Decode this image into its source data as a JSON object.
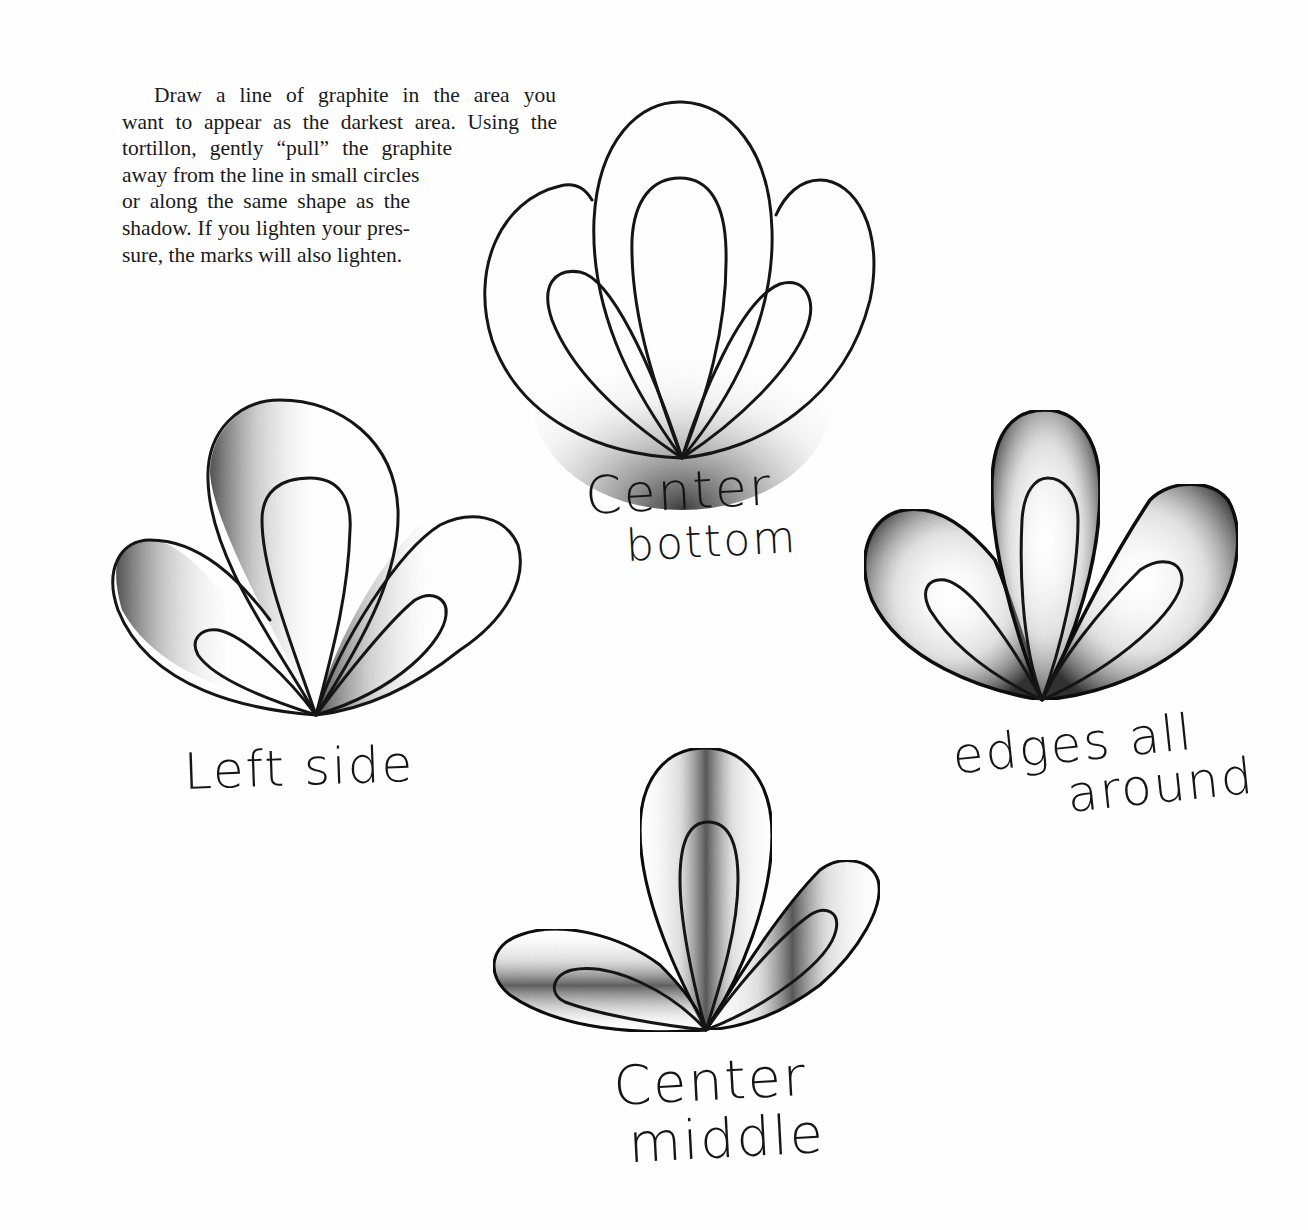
{
  "instructions": {
    "lines": [
      "Draw a line of graphite in the area you",
      "want to appear as the darkest area. Using the",
      "tortillon, gently “pull” the graphite",
      "away from the line in small circles",
      "or along the same shape as the",
      "shadow. If you lighten your pres-",
      "sure, the marks will also lighten."
    ]
  },
  "examples": [
    {
      "id": "center-bottom",
      "label_lines": [
        "Center",
        "bottom"
      ]
    },
    {
      "id": "left-side",
      "label_lines": [
        "Left side"
      ]
    },
    {
      "id": "edges-all-around",
      "label_lines": [
        "edges all",
        "around"
      ]
    },
    {
      "id": "center-middle",
      "label_lines": [
        "Center",
        "middle"
      ]
    }
  ],
  "colors": {
    "ink": "#151515",
    "graphite_dark": "#3a3a3a",
    "graphite_light": "#bdbdbd",
    "paper": "#fefefe"
  }
}
